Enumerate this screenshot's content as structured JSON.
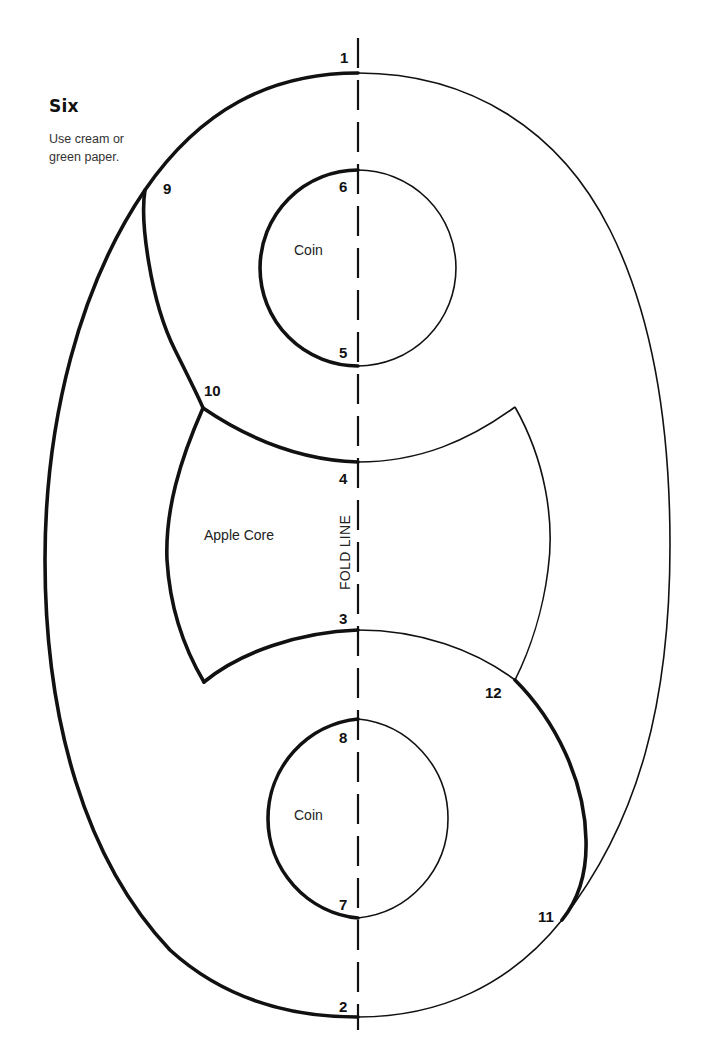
{
  "header": {
    "title": "Six",
    "instructions": "Use cream or green paper."
  },
  "pieces": {
    "coin_top": "Coin",
    "coin_bottom": "Coin",
    "apple_core": "Apple Core"
  },
  "fold_line": {
    "label": "FOLD LINE"
  },
  "points": {
    "p1": "1",
    "p2": "2",
    "p3": "3",
    "p4": "4",
    "p5": "5",
    "p6": "6",
    "p7": "7",
    "p8": "8",
    "p9": "9",
    "p10": "10",
    "p11": "11",
    "p12": "12"
  },
  "colors": {
    "line": "#111111",
    "background": "#ffffff"
  }
}
